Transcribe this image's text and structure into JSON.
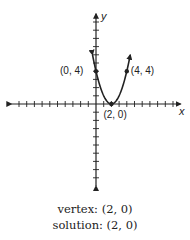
{
  "chart_data": {
    "type": "line",
    "title": "",
    "function": "y = (x - 2)^2",
    "xlabel": "x",
    "ylabel": "y",
    "xlim": [
      -11,
      11
    ],
    "ylim": [
      -10,
      11
    ],
    "grid": false,
    "ticks": {
      "x_step": 1,
      "y_step": 1
    },
    "points": [
      {
        "x": 0,
        "y": 4,
        "label": "(0, 4)"
      },
      {
        "x": 2,
        "y": 0,
        "label": "(2, 0)"
      },
      {
        "x": 4,
        "y": 4,
        "label": "(4, 4)"
      }
    ],
    "annotations": [
      "vertex: (2, 0)",
      "solution: (2, 0)"
    ]
  },
  "captions": {
    "vertex": "vertex: (2, 0)",
    "solution": "solution: (2, 0)"
  },
  "colors": {
    "ink": "#222222",
    "background": "#ffffff"
  }
}
